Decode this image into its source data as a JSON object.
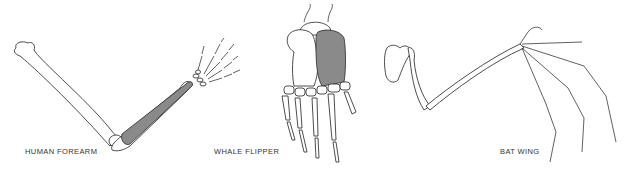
{
  "figure": {
    "panels": [
      {
        "id": "human",
        "label": "HUMAN FOREARM"
      },
      {
        "id": "whale",
        "label": "WHALE FLIPPER"
      },
      {
        "id": "bat",
        "label": "BAT WING"
      }
    ],
    "colors": {
      "background": "#ffffff",
      "outline": "#3a3a3a",
      "highlighted_bone": "#8a8a8a"
    }
  }
}
